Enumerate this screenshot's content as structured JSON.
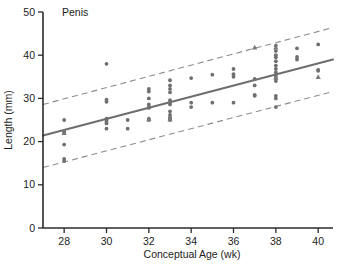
{
  "chart_data": {
    "type": "scatter",
    "title": "Penis",
    "xlabel": "Conceptual Age (wk)",
    "ylabel": "Length (mm)",
    "xlim": [
      27,
      40.7
    ],
    "ylim": [
      0,
      50
    ],
    "xticks": [
      28,
      30,
      32,
      34,
      36,
      38,
      40
    ],
    "xtick_labels": [
      "28",
      "30",
      "32",
      "34",
      "36",
      "38",
      "40"
    ],
    "yticks": [
      0,
      10,
      20,
      30,
      40,
      50
    ],
    "ytick_labels": [
      "0",
      "10",
      "20",
      "30",
      "40",
      "50"
    ],
    "grid": false,
    "legend": "none",
    "series": [
      {
        "name": "Observations",
        "marker": "circle",
        "color": "#6f6f6f",
        "points": [
          [
            28.0,
            25.0
          ],
          [
            28.0,
            22.3
          ],
          [
            28.0,
            22.0
          ],
          [
            28.0,
            19.3
          ],
          [
            28.0,
            16.0
          ],
          [
            28.0,
            15.5
          ],
          [
            30.0,
            38.0
          ],
          [
            30.0,
            29.7
          ],
          [
            30.0,
            29.2
          ],
          [
            30.0,
            25.3
          ],
          [
            30.0,
            25.0
          ],
          [
            30.0,
            24.6
          ],
          [
            30.0,
            24.2
          ],
          [
            30.0,
            23.0
          ],
          [
            31.0,
            25.0
          ],
          [
            31.0,
            23.0
          ],
          [
            32.0,
            32.2
          ],
          [
            32.0,
            31.6
          ],
          [
            32.0,
            30.0
          ],
          [
            32.0,
            28.6
          ],
          [
            32.0,
            28.0
          ],
          [
            32.0,
            27.8
          ],
          [
            32.0,
            25.3
          ],
          [
            32.0,
            25.0
          ],
          [
            33.0,
            34.2
          ],
          [
            33.0,
            33.0
          ],
          [
            33.0,
            32.2
          ],
          [
            33.0,
            31.4
          ],
          [
            33.0,
            29.6
          ],
          [
            33.0,
            29.0
          ],
          [
            33.0,
            28.6
          ],
          [
            33.0,
            27.0
          ],
          [
            33.0,
            26.2
          ],
          [
            33.0,
            25.6
          ],
          [
            33.0,
            25.2
          ],
          [
            33.0,
            25.0
          ],
          [
            34.0,
            34.7
          ],
          [
            34.0,
            29.0
          ],
          [
            34.0,
            28.0
          ],
          [
            35.0,
            35.5
          ],
          [
            35.0,
            29.0
          ],
          [
            36.0,
            36.8
          ],
          [
            36.0,
            35.6
          ],
          [
            36.0,
            35.0
          ],
          [
            36.0,
            29.0
          ],
          [
            37.0,
            34.5
          ],
          [
            37.0,
            33.0
          ],
          [
            37.0,
            30.8
          ],
          [
            37.0,
            30.6
          ],
          [
            38.0,
            42.2
          ],
          [
            38.0,
            41.0
          ],
          [
            38.0,
            40.0
          ],
          [
            38.0,
            39.5
          ],
          [
            38.0,
            38.6
          ],
          [
            38.0,
            37.6
          ],
          [
            38.0,
            36.8
          ],
          [
            38.0,
            36.0
          ],
          [
            38.0,
            35.4
          ],
          [
            38.0,
            35.0
          ],
          [
            38.0,
            34.6
          ],
          [
            38.0,
            34.0
          ],
          [
            38.0,
            30.6
          ],
          [
            38.0,
            30.0
          ],
          [
            38.0,
            28.0
          ],
          [
            39.0,
            41.6
          ],
          [
            39.0,
            39.6
          ],
          [
            39.0,
            39.0
          ],
          [
            40.0,
            42.5
          ],
          [
            40.0,
            36.6
          ],
          [
            40.0,
            36.4
          ]
        ]
      },
      {
        "name": "Observations (triangle)",
        "marker": "triangle",
        "color": "#7a7a7a",
        "points": [
          [
            28.0,
            22.0
          ],
          [
            32.0,
            25.2
          ],
          [
            33.0,
            25.2
          ],
          [
            37.0,
            41.8
          ],
          [
            38.0,
            41.8
          ],
          [
            38.0,
            34.8
          ],
          [
            40.0,
            35.0
          ]
        ]
      }
    ],
    "fit_line": {
      "name": "Regression line",
      "style": "solid",
      "color": "#6e6e6e",
      "x": [
        27,
        40.7
      ],
      "y": [
        21.4,
        39.0
      ]
    },
    "prediction_interval": [
      {
        "name": "Upper prediction limit",
        "style": "dashed",
        "color": "#8d8d8d",
        "x": [
          27,
          40.7
        ],
        "y": [
          28.6,
          46.4
        ]
      },
      {
        "name": "Lower prediction limit",
        "style": "dashed",
        "color": "#8d8d8d",
        "x": [
          27,
          40.7
        ],
        "y": [
          14.0,
          31.6
        ]
      }
    ]
  }
}
